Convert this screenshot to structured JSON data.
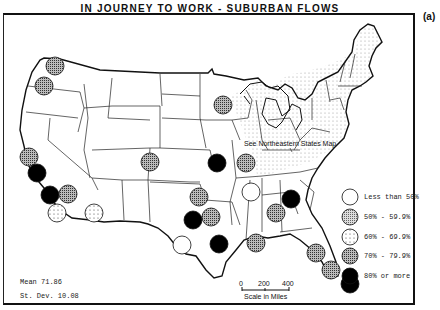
{
  "title": "IN JOURNEY TO WORK - SUBURBAN FLOWS",
  "panel_label": "(a)",
  "annotation": "See Northeastern States Map",
  "statistics": {
    "mean": "Mean 71.86",
    "std_dev": "St. Dev. 10.08"
  },
  "scale": {
    "ticks": [
      "0",
      "200",
      "400"
    ],
    "label": "Scale in Miles"
  },
  "legend": {
    "items": [
      {
        "label": "Less than 50%",
        "class": "lt50"
      },
      {
        "label": "50% - 59.9%",
        "class": "p50"
      },
      {
        "label": "60% - 69.9%",
        "class": "p60"
      },
      {
        "label": "70% - 79.9%",
        "class": "p70"
      },
      {
        "label": "80% or more",
        "class": "p80"
      }
    ]
  },
  "colors": {
    "lt50": "#ffffff",
    "p50": "#b8b8b8",
    "p60": "#f4f4f4",
    "p70": "#8a8a8a",
    "p80": "#000000"
  },
  "symbols": [
    {
      "x": 55,
      "y": 66,
      "class": "p70"
    },
    {
      "x": 44,
      "y": 86,
      "class": "p70"
    },
    {
      "x": 29,
      "y": 157,
      "class": "p70"
    },
    {
      "x": 37,
      "y": 173,
      "class": "p80"
    },
    {
      "x": 50,
      "y": 195,
      "class": "p80"
    },
    {
      "x": 68,
      "y": 194,
      "class": "p70"
    },
    {
      "x": 57,
      "y": 213,
      "class": "p60"
    },
    {
      "x": 94,
      "y": 213,
      "class": "p60"
    },
    {
      "x": 150,
      "y": 162,
      "class": "p70"
    },
    {
      "x": 223,
      "y": 105,
      "class": "p70"
    },
    {
      "x": 217,
      "y": 163,
      "class": "p80"
    },
    {
      "x": 246,
      "y": 163,
      "class": "p70"
    },
    {
      "x": 199,
      "y": 197,
      "class": "p70"
    },
    {
      "x": 193,
      "y": 220,
      "class": "p80"
    },
    {
      "x": 211,
      "y": 217,
      "class": "p70"
    },
    {
      "x": 182,
      "y": 245,
      "class": "lt50"
    },
    {
      "x": 219,
      "y": 244,
      "class": "p80"
    },
    {
      "x": 251,
      "y": 192,
      "class": "lt50"
    },
    {
      "x": 276,
      "y": 213,
      "class": "p70"
    },
    {
      "x": 291,
      "y": 199,
      "class": "p80"
    },
    {
      "x": 256,
      "y": 243,
      "class": "p70"
    },
    {
      "x": 316,
      "y": 253,
      "class": "p70"
    },
    {
      "x": 331,
      "y": 270,
      "class": "p70"
    },
    {
      "x": 350,
      "y": 284,
      "class": "p80"
    }
  ]
}
